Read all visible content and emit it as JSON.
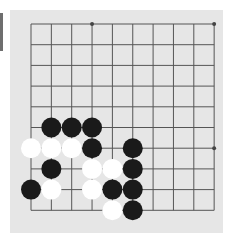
{
  "board": {
    "background": "#e6e6e6",
    "line_color": "#555555",
    "columns": 10,
    "rows": 10,
    "origin": {
      "x": 21,
      "y": 14
    },
    "spacing": {
      "x": 20.35,
      "y": 20.7
    },
    "star_points": [
      [
        3,
        0
      ],
      [
        9,
        0
      ],
      [
        3,
        6
      ],
      [
        9,
        6
      ]
    ],
    "stones": [
      {
        "color": "black",
        "col": 1,
        "row": 5
      },
      {
        "color": "black",
        "col": 2,
        "row": 5
      },
      {
        "color": "black",
        "col": 3,
        "row": 5
      },
      {
        "color": "white",
        "col": 0,
        "row": 6
      },
      {
        "color": "white",
        "col": 1,
        "row": 6
      },
      {
        "color": "white",
        "col": 2,
        "row": 6
      },
      {
        "color": "black",
        "col": 3,
        "row": 6
      },
      {
        "color": "black",
        "col": 5,
        "row": 6
      },
      {
        "color": "black",
        "col": 1,
        "row": 7
      },
      {
        "color": "white",
        "col": 3,
        "row": 7
      },
      {
        "color": "white",
        "col": 4,
        "row": 7
      },
      {
        "color": "black",
        "col": 5,
        "row": 7
      },
      {
        "color": "black",
        "col": 0,
        "row": 8
      },
      {
        "color": "white",
        "col": 1,
        "row": 8
      },
      {
        "color": "white",
        "col": 3,
        "row": 8
      },
      {
        "color": "black",
        "col": 4,
        "row": 8
      },
      {
        "color": "black",
        "col": 5,
        "row": 8
      },
      {
        "color": "white",
        "col": 4,
        "row": 9
      },
      {
        "color": "black",
        "col": 5,
        "row": 9
      }
    ],
    "colors": {
      "black": "#1a1a1a",
      "white": "#ffffff"
    }
  }
}
